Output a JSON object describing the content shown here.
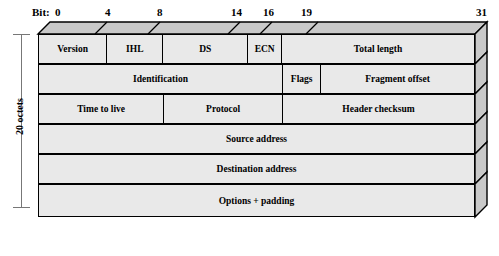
{
  "diagram": {
    "bit_caption": "Bit:",
    "size_label": "20 octets",
    "colors": {
      "front_face": "#e9e9e9",
      "top_face": "#c9c9c9",
      "side_face": "#c9c9c9",
      "outline": "#000000",
      "bracket": "#777777"
    },
    "bit_ticks": [
      {
        "label": "0",
        "bit": 0,
        "x": 57
      },
      {
        "label": "4",
        "bit": 4,
        "x": 107
      },
      {
        "label": "8",
        "bit": 8,
        "x": 159
      },
      {
        "label": "14",
        "bit": 14,
        "x": 236
      },
      {
        "label": "16",
        "bit": 16,
        "x": 268
      },
      {
        "label": "19",
        "bit": 19,
        "x": 306
      },
      {
        "label": "31",
        "bit": 31,
        "x": 481
      }
    ],
    "rows": [
      {
        "index": 0,
        "cells": [
          {
            "label": "Version",
            "bits": 4,
            "width_pct": 15.7
          },
          {
            "label": "IHL",
            "bits": 4,
            "width_pct": 12.9
          },
          {
            "label": "DS",
            "bits": 6,
            "width_pct": 19.5
          },
          {
            "label": "ECN",
            "bits": 2,
            "width_pct": 7.8
          },
          {
            "label": "Total length",
            "bits": 16,
            "width_pct": 44.1
          }
        ]
      },
      {
        "index": 1,
        "cells": [
          {
            "label": "Identification",
            "bits": 16,
            "width_pct": 56.1
          },
          {
            "label": "Flags",
            "bits": 3,
            "width_pct": 8.8
          },
          {
            "label": "Fragment offset",
            "bits": 13,
            "width_pct": 35.1
          }
        ]
      },
      {
        "index": 2,
        "cells": [
          {
            "label": "Time to live",
            "bits": 8,
            "width_pct": 28.8
          },
          {
            "label": "Protocol",
            "bits": 8,
            "width_pct": 27.3
          },
          {
            "label": "Header checksum",
            "bits": 16,
            "width_pct": 43.9
          }
        ]
      },
      {
        "index": 3,
        "cells": [
          {
            "label": "Source address",
            "bits": 32,
            "width_pct": 100
          }
        ]
      },
      {
        "index": 4,
        "cells": [
          {
            "label": "Destination address",
            "bits": 32,
            "width_pct": 100
          }
        ]
      },
      {
        "index": 5,
        "cells": [
          {
            "label": "Options + padding",
            "bits": 32,
            "width_pct": 100
          }
        ]
      }
    ]
  }
}
